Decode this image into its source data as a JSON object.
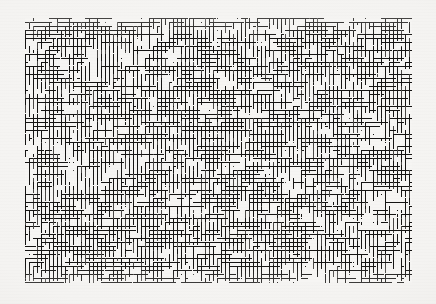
{
  "artwork": {
    "title": "Dense maze texture plate",
    "kind": "generative-noise-pattern",
    "description": "Dense field of short black horizontal runs with downward tick marks, maze / comb-like, on an off-white ground",
    "canvas": {
      "width": 436,
      "height": 304
    },
    "margins": {
      "left": 25,
      "top": 18,
      "right": 24,
      "bottom": 21
    },
    "field": {
      "x": 25,
      "y": 18,
      "width": 387,
      "height": 265
    },
    "colors": {
      "page_background": "#f3f2f0",
      "field_background": "#f6f5f3",
      "ink": "#141312",
      "ink_light": "#4a4846",
      "vignette_edge": "#e6e4e0"
    },
    "grid": {
      "cell": 4,
      "line_weight": 1,
      "columns": 97,
      "rows": 67
    },
    "generator": {
      "seed": 20240517,
      "horizontal_run_min": 1,
      "horizontal_run_max": 11,
      "tick_length_min": 2,
      "tick_length_max": 5,
      "run_probability": 0.52,
      "tick_probability": 0.46,
      "long_comb_probability": 0.05,
      "long_comb_min": 8,
      "long_comb_max": 22,
      "stray_dot_probability": 0.2
    },
    "density": {
      "overall": 0.41,
      "left": 0.44,
      "center": 0.42,
      "right": 0.38
    }
  }
}
